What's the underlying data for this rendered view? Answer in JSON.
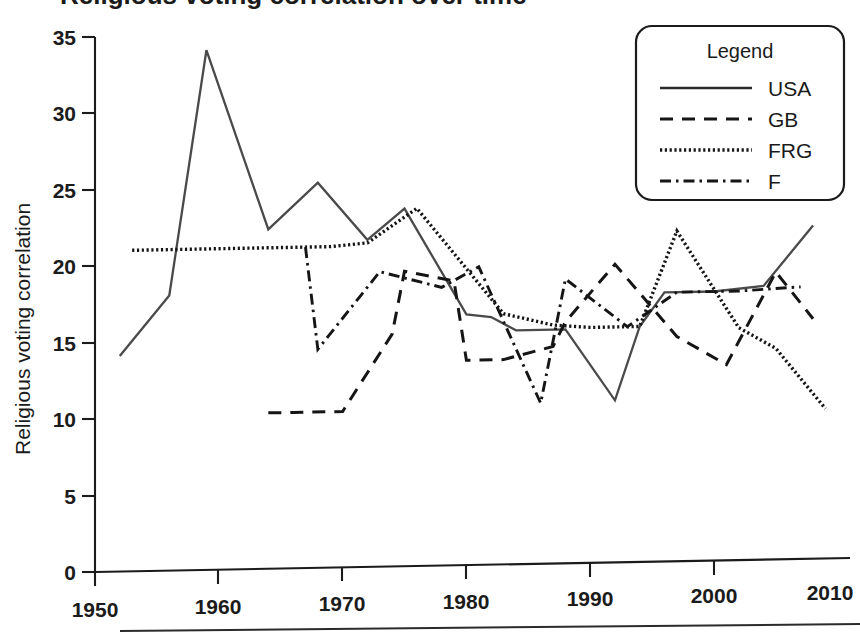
{
  "figure": {
    "title_partial": "Religious voting correlation over time",
    "width": 860,
    "height": 633
  },
  "axes": {
    "ylabel": "Religious voting correlation",
    "xlabel": "",
    "y_ticks": [
      "0",
      "5",
      "10",
      "15",
      "20",
      "25",
      "30",
      "35"
    ],
    "x_ticks": [
      "1950",
      "1960",
      "1970",
      "1980",
      "1990",
      "2000",
      "2010"
    ]
  },
  "legend": {
    "title": "Legend",
    "entries": [
      {
        "label": "USA",
        "style": "solid"
      },
      {
        "label": "GB",
        "style": "dashed"
      },
      {
        "label": "FRG",
        "style": "dotted"
      },
      {
        "label": "F",
        "style": "dash-dot"
      }
    ]
  },
  "colors": {
    "ink": "#1b1b1b",
    "usa_line": "#4a4a4a",
    "background": "#ffffff"
  },
  "chart_data": {
    "type": "line",
    "title": "Religious voting correlation over time",
    "xlabel": "",
    "ylabel": "Religious voting correlation",
    "xlim": [
      1950,
      2010
    ],
    "ylim": [
      0,
      35
    ],
    "xticks": [
      1950,
      1960,
      1970,
      1980,
      1990,
      2000,
      2010
    ],
    "yticks": [
      0,
      5,
      10,
      15,
      20,
      25,
      30,
      35
    ],
    "grid": false,
    "legend_position": "top-right",
    "series": [
      {
        "name": "USA",
        "style": "solid",
        "points": [
          [
            1952,
            14.1
          ],
          [
            1956,
            18.0
          ],
          [
            1959,
            34.0
          ],
          [
            1964,
            22.2
          ],
          [
            1968,
            25.2
          ],
          [
            1972,
            21.4
          ],
          [
            1975,
            23.4
          ],
          [
            1980,
            16.4
          ],
          [
            1982,
            16.2
          ],
          [
            1984,
            15.3
          ],
          [
            1988,
            15.3
          ],
          [
            1992,
            10.6
          ],
          [
            1994,
            15.4
          ],
          [
            1996,
            17.6
          ],
          [
            2000,
            17.6
          ],
          [
            2004,
            17.9
          ],
          [
            2008,
            21.8
          ]
        ]
      },
      {
        "name": "GB",
        "style": "dashed",
        "points": [
          [
            1964,
            10.2
          ],
          [
            1966,
            10.2
          ],
          [
            1970,
            10.2
          ],
          [
            1974,
            15.2
          ],
          [
            1975,
            19.3
          ],
          [
            1979,
            18.6
          ],
          [
            1980,
            13.4
          ],
          [
            1983,
            13.4
          ],
          [
            1987,
            14.2
          ],
          [
            1988,
            15.8
          ],
          [
            1992,
            19.5
          ],
          [
            1997,
            14.7
          ],
          [
            2001,
            12.8
          ],
          [
            2005,
            18.8
          ],
          [
            2008,
            15.7
          ]
        ]
      },
      {
        "name": "FRG",
        "style": "dotted",
        "points": [
          [
            1953,
            21.0
          ],
          [
            1957,
            21.0
          ],
          [
            1961,
            21.0
          ],
          [
            1965,
            21.0
          ],
          [
            1969,
            21.0
          ],
          [
            1972,
            21.2
          ],
          [
            1976,
            23.4
          ],
          [
            1980,
            19.4
          ],
          [
            1983,
            16.4
          ],
          [
            1987,
            15.6
          ],
          [
            1990,
            15.4
          ],
          [
            1994,
            15.4
          ],
          [
            1997,
            21.6
          ],
          [
            2002,
            15.2
          ],
          [
            2005,
            13.8
          ],
          [
            2009,
            9.8
          ]
        ]
      },
      {
        "name": "F",
        "style": "dash-dot",
        "points": [
          [
            1967,
            21.0
          ],
          [
            1968,
            14.3
          ],
          [
            1973,
            19.3
          ],
          [
            1978,
            18.2
          ],
          [
            1981,
            19.5
          ],
          [
            1986,
            10.5
          ],
          [
            1988,
            18.6
          ],
          [
            1993,
            15.4
          ],
          [
            1997,
            17.6
          ],
          [
            2002,
            17.6
          ],
          [
            2007,
            17.8
          ]
        ]
      }
    ]
  }
}
